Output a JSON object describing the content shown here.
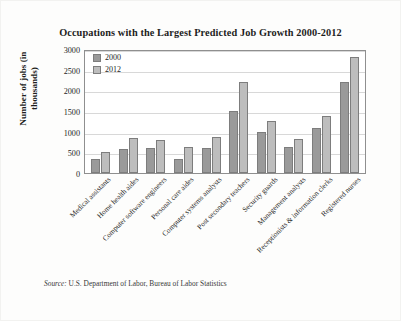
{
  "chart_data": {
    "type": "bar",
    "title": "Occupations with the Largest Predicted Job Growth 2000-2012",
    "xlabel": "",
    "ylabel": "Number of jobs (in thousands)",
    "ylim": [
      0,
      3000
    ],
    "ytick_step": 500,
    "yticks": [
      "3000",
      "2500",
      "2000",
      "1500",
      "1000",
      "500",
      "0"
    ],
    "grid": true,
    "legend_position": "top-left-inside",
    "categories": [
      "Medical assistants",
      "Home health aides",
      "Computer software engineers",
      "Personal care aides",
      "Computer systems analysts",
      "Post secondary teachers",
      "Security guards",
      "Management analysts",
      "Receptionists & information clerks",
      "Registered nurses"
    ],
    "series": [
      {
        "name": "2000",
        "color": "#9a9a9a",
        "values": [
          330,
          580,
          600,
          350,
          600,
          1500,
          1000,
          620,
          1080,
          2200
        ]
      },
      {
        "name": "2012",
        "color": "#bdbdbd",
        "values": [
          520,
          850,
          790,
          620,
          860,
          2200,
          1250,
          820,
          1380,
          2800
        ]
      }
    ]
  },
  "source": {
    "prefix": "Source:",
    "text": "U.S. Department of Labor, Bureau of Labor Statistics"
  }
}
